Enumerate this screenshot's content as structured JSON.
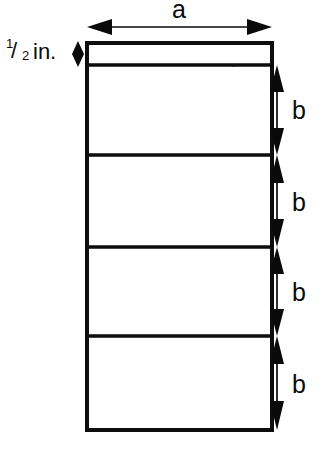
{
  "figure": {
    "kind": "engineering-dimension-diagram",
    "background_color": "#ffffff",
    "line_color": "#0a0a0a",
    "shape": "rectangle divided into a narrow top strip plus four equal sections"
  },
  "labels": {
    "width_label": "a",
    "section_label": "b",
    "strip_numerator": "1",
    "strip_slash": "/",
    "strip_denominator": "2",
    "strip_unit": "in."
  },
  "dimensions": [
    {
      "name": "width",
      "label": "a",
      "orientation": "horizontal",
      "position": "top",
      "arrow": "double-headed"
    },
    {
      "name": "top-strip-height",
      "label": "1/2 in.",
      "orientation": "vertical",
      "position": "left",
      "arrow": "double-headed"
    },
    {
      "name": "section-1-height",
      "label": "b",
      "orientation": "vertical",
      "position": "right",
      "arrow": "double-headed"
    },
    {
      "name": "section-2-height",
      "label": "b",
      "orientation": "vertical",
      "position": "right",
      "arrow": "double-headed"
    },
    {
      "name": "section-3-height",
      "label": "b",
      "orientation": "vertical",
      "position": "right",
      "arrow": "double-headed"
    },
    {
      "name": "section-4-height",
      "label": "b",
      "orientation": "vertical",
      "position": "right",
      "arrow": "double-headed"
    }
  ],
  "geometry": {
    "box_left": 87,
    "box_right": 272,
    "box_top": 43,
    "box_bottom": 430,
    "dividers": [
      65,
      155,
      247,
      336
    ],
    "dim_line_x": 277,
    "dim_line_y_top": 27,
    "label_b_x": 297,
    "b_label_y": [
      118,
      210,
      300,
      392
    ]
  }
}
